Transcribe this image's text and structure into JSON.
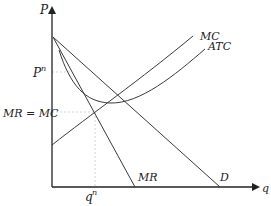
{
  "diagram": {
    "type": "monopoly-price-output",
    "axes": {
      "y_label": "P",
      "x_label": "q"
    },
    "curves": [
      {
        "id": "demand",
        "label": "D"
      },
      {
        "id": "marginal-revenue",
        "label": "MR"
      },
      {
        "id": "marginal-cost",
        "label": "MC"
      },
      {
        "id": "average-total-cost",
        "label": "ATC"
      }
    ],
    "annotations": {
      "price": "P",
      "price_sup": "n",
      "equilibrium": "MR = MC",
      "quantity": "q",
      "quantity_sup": "n"
    },
    "colors": {
      "line": "#3a3a3a",
      "axis": "#222222",
      "guide": "#c8c8c8"
    }
  }
}
